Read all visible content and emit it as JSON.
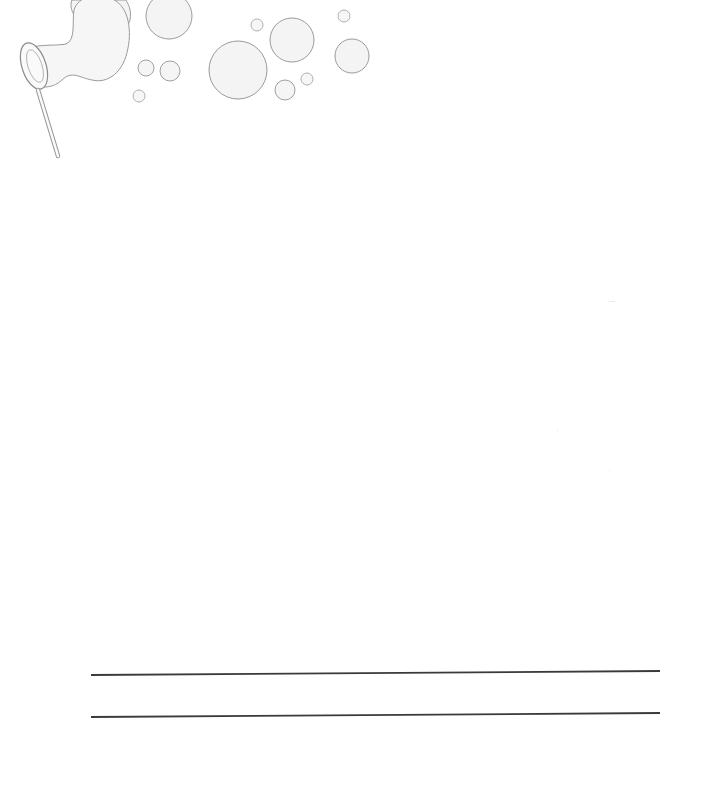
{
  "page": {
    "width": 715,
    "height": 790,
    "background": "#ffffff"
  },
  "illustration": {
    "name": "bubble-wand-illustration",
    "stroke_color": "#9a9a9a",
    "fill_color": "#f4f4f4",
    "wand": {
      "ring": {
        "cx": 34,
        "cy": 66,
        "rx": 14,
        "ry": 26
      },
      "handle": {
        "x1": 38,
        "y1": 90,
        "x2": 60,
        "y2": 156
      }
    },
    "bubbles": [
      {
        "cx": 169,
        "cy": 16,
        "r": 23
      },
      {
        "cx": 146,
        "cy": 68,
        "r": 8
      },
      {
        "cx": 170,
        "cy": 71,
        "r": 10
      },
      {
        "cx": 139,
        "cy": 96,
        "r": 6
      },
      {
        "cx": 238,
        "cy": 70,
        "r": 29
      },
      {
        "cx": 257,
        "cy": 25,
        "r": 6
      },
      {
        "cx": 292,
        "cy": 40,
        "r": 22
      },
      {
        "cx": 285,
        "cy": 90,
        "r": 10
      },
      {
        "cx": 307,
        "cy": 79,
        "r": 6
      },
      {
        "cx": 344,
        "cy": 16,
        "r": 6
      },
      {
        "cx": 352,
        "cy": 56,
        "r": 17
      }
    ]
  },
  "writing_lines": [
    {
      "x1": 91,
      "y": 675,
      "x2": 660,
      "y_end": 671
    },
    {
      "x1": 91,
      "y": 717,
      "x2": 660,
      "y_end": 713
    }
  ],
  "line_color": "#3a3a3a"
}
